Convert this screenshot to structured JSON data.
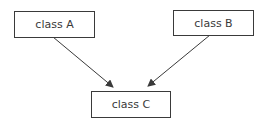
{
  "diagram": {
    "type": "class-hierarchy",
    "nodes": [
      {
        "id": "A",
        "label": "class A"
      },
      {
        "id": "B",
        "label": "class B"
      },
      {
        "id": "C",
        "label": "class C"
      }
    ],
    "edges": [
      {
        "from": "A",
        "to": "C",
        "style": "arrow"
      },
      {
        "from": "B",
        "to": "C",
        "style": "arrow"
      }
    ],
    "colors": {
      "stroke": "#3a3a3a",
      "background": "#ffffff"
    }
  }
}
